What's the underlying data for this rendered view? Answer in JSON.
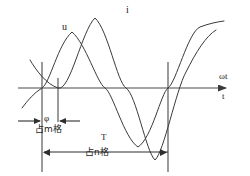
{
  "figure": {
    "title": "",
    "background_color": "#ffffff",
    "line_color": "#3a3a3a",
    "axis_color": "#4a4a4a",
    "text_color": "#1a1a1a"
  },
  "axis": {
    "label_omega_t": "ωt",
    "label_t": "t",
    "baseline_y": 88,
    "start_x": 18,
    "end_x": 232,
    "arrow": "right-arrow-icon"
  },
  "curves": [
    {
      "name": "u",
      "label": "u",
      "label_x": 62,
      "label_y": 28,
      "amplitude": 56,
      "zero_crossing_x": 42,
      "peak_x": 72,
      "trough_x": 138,
      "description": "voltage sinusoid, leading"
    },
    {
      "name": "i",
      "label": "i",
      "label_x": 126,
      "label_y": 10,
      "amplitude": 72,
      "zero_crossing_x": 58,
      "peak_x": 95,
      "trough_x": 155,
      "description": "current sinusoid, lagging"
    }
  ],
  "reference_lines": [
    {
      "name": "u-zero-crossing",
      "x": 42,
      "y_top": 62,
      "y_bottom": 172
    },
    {
      "name": "i-zero-crossing",
      "x": 58,
      "y_top": 78,
      "y_bottom": 122
    },
    {
      "name": "period-end",
      "x": 168,
      "y_top": 62,
      "y_bottom": 172
    }
  ],
  "dimensions": [
    {
      "name": "phase-difference",
      "symbol": "φ",
      "caption": "占m格",
      "symbol_x": 44,
      "symbol_y": 118,
      "caption_x": 36,
      "caption_y": 128,
      "line_y": 121,
      "from_x": 42,
      "to_x": 58,
      "arrow_style": "outward"
    },
    {
      "name": "period",
      "symbol": "T",
      "caption": "占n格",
      "symbol_x": 101,
      "symbol_y": 136,
      "caption_x": 86,
      "caption_y": 151,
      "line_y": 152,
      "from_x": 42,
      "to_x": 168,
      "arrow_style": "inward"
    }
  ]
}
